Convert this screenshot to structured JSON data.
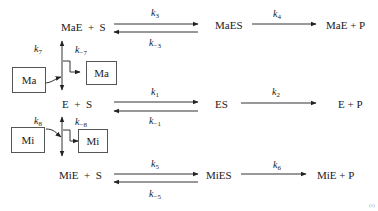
{
  "rows": {
    "top": {
      "left": "MaE  +  S",
      "forward_k": "k",
      "forward_sub": "3",
      "reverse_k": "k",
      "reverse_sub": "−3",
      "complex": "MaES",
      "cat_k": "k",
      "cat_sub": "4",
      "product": "MaE + P"
    },
    "middle": {
      "left": "E  +  S",
      "forward_k": "k",
      "forward_sub": "1",
      "reverse_k": "k",
      "reverse_sub": "−1",
      "complex": "ES",
      "cat_k": "k",
      "cat_sub": "2",
      "product": "E + P"
    },
    "bottom": {
      "left": "MiE  +  S",
      "forward_k": "k",
      "forward_sub": "5",
      "reverse_k": "k",
      "reverse_sub": "−5",
      "complex": "MiES",
      "cat_k": "k",
      "cat_sub": "6",
      "product": "MiE + P"
    }
  },
  "activator": {
    "box_in": "Ma",
    "box_out": "Ma",
    "k_on": "k",
    "k_on_sub": "7",
    "k_off": "k",
    "k_off_sub": "−7"
  },
  "inhibitor": {
    "box_in": "Mi",
    "box_out": "Mi",
    "k_on": "k",
    "k_on_sub": "8",
    "k_off": "k",
    "k_off_sub": "−8"
  },
  "corner_mark": "(1)",
  "colors": {
    "line": "#333333",
    "text": "#1a1a1a",
    "box_border": "#555555"
  }
}
